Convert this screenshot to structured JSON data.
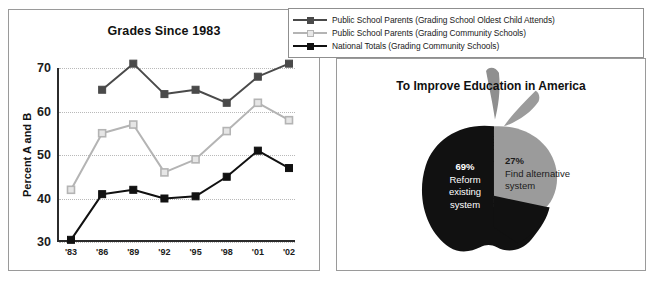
{
  "line_chart_panel": {
    "title": "Grades Since 1983",
    "ylabel": "Percent A and B"
  },
  "legend": {
    "items": [
      {
        "label": "Public School Parents (Grading School Oldest Child Attends)",
        "color": "#4a4a4a",
        "marker": "filled-square"
      },
      {
        "label": "Public School Parents (Grading Community Schools)",
        "color": "#b4b4b4",
        "marker": "open-square"
      },
      {
        "label": "National Totals (Grading Community Schools)",
        "color": "#111111",
        "marker": "filled-square"
      }
    ]
  },
  "pie_panel": {
    "title": "To Improve Education in America",
    "slices": [
      {
        "percent": "69%",
        "line1": "Reform",
        "line2": "existing",
        "line3": "system",
        "color": "#111111"
      },
      {
        "percent": "27%",
        "line1": "Find alternative",
        "line2": "system",
        "line3": "",
        "color": "#9b9b9b"
      }
    ]
  },
  "chart_data": [
    {
      "type": "line",
      "title": "Grades Since 1983",
      "xlabel": "",
      "ylabel": "Percent A and B",
      "categories": [
        "'83",
        "'86",
        "'89",
        "'92",
        "'95",
        "'98",
        "'01",
        "'02"
      ],
      "ylim": [
        30,
        70
      ],
      "yticks": [
        30,
        40,
        50,
        60,
        70
      ],
      "grid": true,
      "legend_position": "top-right-outside",
      "series": [
        {
          "name": "Public School Parents (Grading School Oldest Child Attends)",
          "color": "#4a4a4a",
          "values": [
            null,
            65,
            71,
            64,
            65,
            62,
            68,
            71
          ]
        },
        {
          "name": "Public School Parents (Grading Community Schools)",
          "color": "#b4b4b4",
          "values": [
            42,
            55,
            57,
            46,
            49,
            55.5,
            62,
            58
          ]
        },
        {
          "name": "National Totals (Grading Community Schools)",
          "color": "#111111",
          "values": [
            30.5,
            41,
            42,
            40,
            40.5,
            45,
            51,
            47
          ]
        }
      ]
    },
    {
      "type": "pie",
      "title": "To Improve Education in America",
      "labels": [
        "Reform existing system",
        "Find alternative system"
      ],
      "values": [
        69,
        27
      ],
      "display_values": [
        "69%",
        "27%"
      ],
      "colors": [
        "#111111",
        "#9b9b9b"
      ],
      "shape": "apple"
    }
  ]
}
